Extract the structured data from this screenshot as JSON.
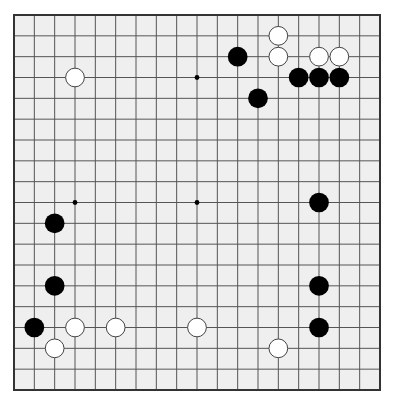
{
  "board": {
    "size": 19,
    "background": "#efefef",
    "line_color": "#555555",
    "border_color": "#333333",
    "origin": {
      "x": 14,
      "y": 15
    },
    "extent": {
      "x": 380,
      "y": 390
    },
    "star_points": [
      [
        3,
        3
      ],
      [
        9,
        3
      ],
      [
        15,
        3
      ],
      [
        3,
        9
      ],
      [
        9,
        9
      ],
      [
        15,
        9
      ],
      [
        3,
        15
      ],
      [
        9,
        15
      ],
      [
        15,
        15
      ]
    ],
    "stones": [
      {
        "color": "white",
        "col": 3,
        "row": 3
      },
      {
        "color": "white",
        "col": 13,
        "row": 1
      },
      {
        "color": "white",
        "col": 13,
        "row": 2
      },
      {
        "color": "black",
        "col": 11,
        "row": 2
      },
      {
        "color": "white",
        "col": 15,
        "row": 2
      },
      {
        "color": "white",
        "col": 16,
        "row": 2
      },
      {
        "color": "black",
        "col": 14,
        "row": 3
      },
      {
        "color": "black",
        "col": 15,
        "row": 3
      },
      {
        "color": "black",
        "col": 16,
        "row": 3
      },
      {
        "color": "black",
        "col": 12,
        "row": 4
      },
      {
        "color": "black",
        "col": 15,
        "row": 9
      },
      {
        "color": "black",
        "col": 2,
        "row": 10
      },
      {
        "color": "black",
        "col": 2,
        "row": 13
      },
      {
        "color": "black",
        "col": 15,
        "row": 13
      },
      {
        "color": "black",
        "col": 1,
        "row": 15
      },
      {
        "color": "white",
        "col": 3,
        "row": 15
      },
      {
        "color": "white",
        "col": 5,
        "row": 15
      },
      {
        "color": "white",
        "col": 9,
        "row": 15
      },
      {
        "color": "black",
        "col": 15,
        "row": 15
      },
      {
        "color": "white",
        "col": 2,
        "row": 16
      },
      {
        "color": "white",
        "col": 13,
        "row": 16
      }
    ],
    "colors": {
      "black_stone": "#000000",
      "white_stone": "#ffffff",
      "white_stone_outline": "#444444"
    }
  }
}
